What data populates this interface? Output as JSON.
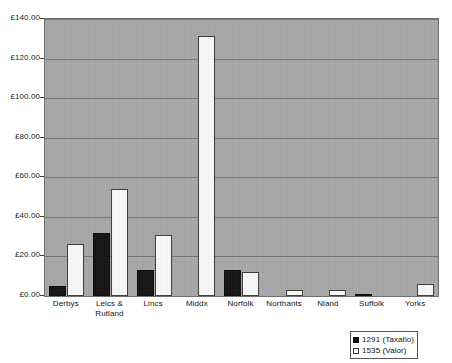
{
  "chart_data": {
    "type": "bar",
    "title": "",
    "subtitle": "",
    "xlabel": "",
    "ylabel": "",
    "categories": [
      "Derbys",
      "Leics & Rutland",
      "Lincs",
      "Middx",
      "Norfolk",
      "Northants",
      "Nland",
      "Suffolk",
      "Yorks"
    ],
    "series": [
      {
        "name": "1291 (Taxatio)",
        "color": "#141414",
        "values": [
          5.0,
          32.0,
          13.0,
          0.0,
          13.0,
          0.0,
          0.0,
          1.0,
          0.0
        ]
      },
      {
        "name": "1535 (Valor)",
        "color": "#ffffff",
        "values": [
          26.5,
          54.0,
          31.0,
          131.5,
          12.0,
          3.0,
          3.0,
          0.0,
          6.0
        ]
      }
    ],
    "ylim": [
      0,
      140
    ],
    "yticks": [
      0,
      20,
      40,
      60,
      80,
      100,
      120,
      140
    ],
    "ytick_labels": [
      "£0.00",
      "£20.00",
      "£40.00",
      "£60.00",
      "£80.00",
      "£100.00",
      "£120.00",
      "£140.00"
    ],
    "currency_symbol": "£",
    "grid": "horizontal",
    "legend_position": "bottom-right",
    "plot_background": "#a9a9a9"
  },
  "legend": {
    "items": [
      {
        "label": "1291 (Taxatio)",
        "swatch": "filled-black-square"
      },
      {
        "label": "1535 (Valor)",
        "swatch": "open-white-square"
      }
    ]
  },
  "page_bleed": {
    "top_line": "",
    "bottom_line_1": "",
    "bottom_line_2": "",
    "bottom_line_3": ""
  }
}
